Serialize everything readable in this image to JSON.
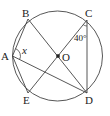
{
  "diagram": {
    "circle": {
      "cx": 57.5,
      "cy": 56,
      "r": 45,
      "stroke": "#444444"
    },
    "points": {
      "A": {
        "label": "A",
        "x": 12.5,
        "y": 56
      },
      "B": {
        "label": "B",
        "x": 28,
        "y": 19
      },
      "C": {
        "label": "C",
        "x": 87,
        "y": 20
      },
      "D": {
        "label": "D",
        "x": 87,
        "y": 93
      },
      "E": {
        "label": "E",
        "x": 28,
        "y": 93
      },
      "O": {
        "label": "O",
        "x": 58,
        "y": 56
      }
    },
    "segments": [
      {
        "from": "A",
        "to": "B"
      },
      {
        "from": "A",
        "to": "E"
      },
      {
        "from": "A",
        "to": "D"
      },
      {
        "from": "B",
        "to": "D"
      },
      {
        "from": "C",
        "to": "E"
      },
      {
        "from": "C",
        "to": "D"
      }
    ],
    "angles": {
      "x": {
        "label": "x",
        "vertex": "A"
      },
      "c": {
        "label": "40°",
        "vertex": "C"
      }
    },
    "line_color": "#444444",
    "text_color": "#222222"
  }
}
